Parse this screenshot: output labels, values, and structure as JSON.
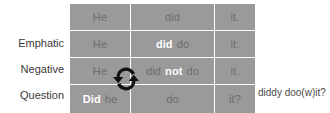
{
  "diagram": {
    "title_annotation": "diddy doo(w)it?",
    "icon": "swap-circular-arrows-icon",
    "colors": {
      "cell_background": "#9a9a9a",
      "cell_text": "#6d6d6d",
      "emphasis_text": "#ffffff",
      "label_text": "#3a3a3a",
      "page_background": "#ffffff"
    },
    "row_labels": [
      "",
      "Emphatic",
      "Negative",
      "Question"
    ],
    "rows": [
      {
        "label": "",
        "cells": [
          {
            "tokens": [
              {
                "text": "He",
                "emphasis": false
              }
            ]
          },
          {
            "tokens": [
              {
                "text": "did",
                "emphasis": false
              }
            ]
          },
          {
            "tokens": [
              {
                "text": "it.",
                "emphasis": false
              }
            ]
          }
        ]
      },
      {
        "label": "Emphatic",
        "cells": [
          {
            "tokens": [
              {
                "text": "He",
                "emphasis": false
              }
            ]
          },
          {
            "tokens": [
              {
                "text": "did",
                "emphasis": true
              },
              {
                "text": "do",
                "emphasis": false
              }
            ]
          },
          {
            "tokens": [
              {
                "text": "it.",
                "emphasis": false
              }
            ]
          }
        ]
      },
      {
        "label": "Negative",
        "cells": [
          {
            "tokens": [
              {
                "text": "He",
                "emphasis": false
              }
            ]
          },
          {
            "tokens": [
              {
                "text": "did",
                "emphasis": false
              },
              {
                "text": "not",
                "emphasis": true
              },
              {
                "text": "do",
                "emphasis": false
              }
            ]
          },
          {
            "tokens": [
              {
                "text": "it.",
                "emphasis": false
              }
            ]
          }
        ]
      },
      {
        "label": "Question",
        "cells": [
          {
            "tokens": [
              {
                "text": "Did",
                "emphasis": true
              },
              {
                "text": "he",
                "emphasis": false
              }
            ]
          },
          {
            "tokens": [
              {
                "text": "do",
                "emphasis": false
              }
            ]
          },
          {
            "tokens": [
              {
                "text": "it?",
                "emphasis": false
              }
            ]
          }
        ]
      }
    ]
  }
}
